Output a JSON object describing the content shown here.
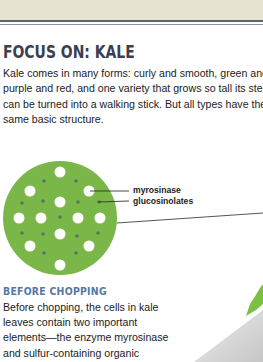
{
  "header": {
    "band_color": "#e6e3d3",
    "rule_color": "#5a6370"
  },
  "section": {
    "title": "FOCUS ON: KALE",
    "intro_lines": [
      "Kale comes in many forms: curly and smooth, green and",
      "purple and red, and one variety that grows so tall its stem",
      "can be turned into a walking stick. But all types have the",
      "same basic structure."
    ]
  },
  "diagram": {
    "cell_color": "#7ab648",
    "labels": {
      "myrosinase": "myrosinase",
      "glucosinolates": "glucosinolates"
    }
  },
  "before_chopping": {
    "heading": "BEFORE CHOPPING",
    "heading_color": "#5578a5",
    "lines": [
      "Before chopping, the cells in kale",
      "leaves contain two important",
      "elements—the enzyme myrosinase",
      "and sulfur-containing organic"
    ]
  }
}
